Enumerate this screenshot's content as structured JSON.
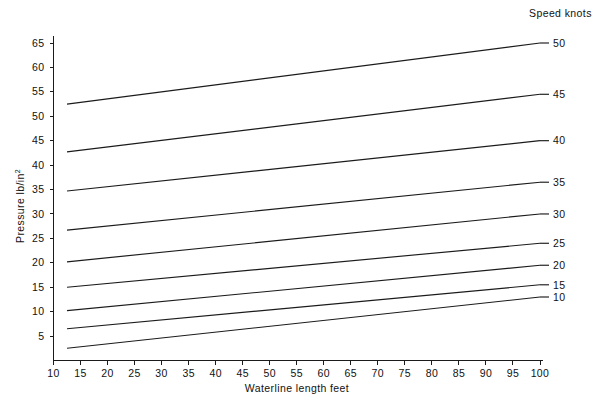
{
  "chart_data": {
    "type": "line",
    "title": "",
    "xlabel": "Waterline length feet",
    "ylabel": "Pressure lb/in",
    "ylabel_superscript": "2",
    "legend_title": "Speed knots",
    "legend_position": "right-outside",
    "grid": false,
    "xlim": [
      10,
      100
    ],
    "ylim": [
      0,
      67
    ],
    "xticks": [
      10,
      15,
      20,
      25,
      30,
      35,
      40,
      45,
      50,
      55,
      60,
      65,
      70,
      75,
      80,
      85,
      90,
      95,
      100
    ],
    "yticks": [
      5,
      10,
      15,
      20,
      25,
      30,
      35,
      40,
      45,
      50,
      55,
      60,
      65
    ],
    "x": [
      12.5,
      100
    ],
    "series": [
      {
        "name": "50",
        "unit": "knots",
        "values": [
          52.5,
          65.0
        ]
      },
      {
        "name": "45",
        "unit": "knots",
        "values": [
          42.7,
          54.5
        ]
      },
      {
        "name": "40",
        "unit": "knots",
        "values": [
          34.7,
          45.0
        ]
      },
      {
        "name": "35",
        "unit": "knots",
        "values": [
          26.7,
          36.5
        ]
      },
      {
        "name": "30",
        "unit": "knots",
        "values": [
          20.2,
          30.0
        ]
      },
      {
        "name": "25",
        "unit": "knots",
        "values": [
          15.0,
          24.0
        ]
      },
      {
        "name": "20",
        "unit": "knots",
        "values": [
          10.2,
          19.5
        ]
      },
      {
        "name": "15",
        "unit": "knots",
        "values": [
          6.5,
          15.5
        ]
      },
      {
        "name": "10",
        "unit": "knots",
        "values": [
          2.5,
          13.0
        ]
      }
    ]
  },
  "colors": {
    "line": "#1b1b1b",
    "axis": "#1b1b1b",
    "background": "#ffffff",
    "text": "#111111"
  }
}
